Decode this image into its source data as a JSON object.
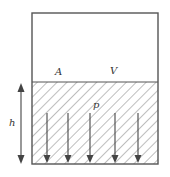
{
  "diagram": {
    "title": "",
    "labels": {
      "area": "A",
      "volume": "V",
      "pressure": "p",
      "height": "h"
    },
    "colors": {
      "stroke": "#555555",
      "hatch": "#9a9a9a",
      "text": "#333333",
      "background": "#ffffff"
    },
    "container": {
      "x": 32,
      "y": 13,
      "width": 126,
      "height": 151
    },
    "fluid_surface_y": 82,
    "pressure_arrows_x": [
      47,
      68,
      90,
      115,
      138
    ],
    "pressure_arrows_top_y": 113,
    "height_dimension": {
      "x": 21,
      "y_top": 83,
      "y_bottom": 164
    }
  }
}
